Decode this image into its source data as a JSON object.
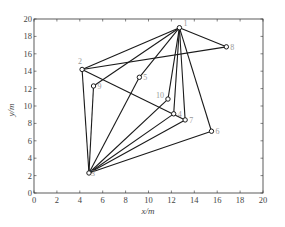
{
  "chart_data": {
    "type": "scatter",
    "title": "",
    "xlabel": "x/m",
    "ylabel": "y/m",
    "xlim": [
      0,
      20
    ],
    "ylim": [
      0,
      20
    ],
    "xticks": [
      0,
      2,
      4,
      6,
      8,
      10,
      12,
      14,
      16,
      18,
      20
    ],
    "yticks": [
      0,
      2,
      4,
      6,
      8,
      10,
      12,
      14,
      16,
      18,
      20
    ],
    "grid": false,
    "legend": null,
    "nodes": [
      {
        "id": "1",
        "x": 12.7,
        "y": 19.0
      },
      {
        "id": "2",
        "x": 4.2,
        "y": 14.2
      },
      {
        "id": "3",
        "x": 4.8,
        "y": 2.3
      },
      {
        "id": "4",
        "x": 12.2,
        "y": 9.1
      },
      {
        "id": "5",
        "x": 9.2,
        "y": 13.3
      },
      {
        "id": "6",
        "x": 15.5,
        "y": 7.1
      },
      {
        "id": "7",
        "x": 13.2,
        "y": 8.4
      },
      {
        "id": "8",
        "x": 16.8,
        "y": 16.8
      },
      {
        "id": "9",
        "x": 5.2,
        "y": 12.3
      },
      {
        "id": "10",
        "x": 11.7,
        "y": 10.8
      }
    ],
    "edges": [
      [
        "1",
        "2"
      ],
      [
        "1",
        "9"
      ],
      [
        "1",
        "5"
      ],
      [
        "1",
        "10"
      ],
      [
        "1",
        "4"
      ],
      [
        "1",
        "7"
      ],
      [
        "1",
        "6"
      ],
      [
        "1",
        "8"
      ],
      [
        "2",
        "8"
      ],
      [
        "2",
        "7"
      ],
      [
        "3",
        "2"
      ],
      [
        "3",
        "9"
      ],
      [
        "3",
        "5"
      ],
      [
        "3",
        "10"
      ],
      [
        "3",
        "4"
      ],
      [
        "3",
        "7"
      ],
      [
        "3",
        "6"
      ]
    ]
  },
  "colors": {
    "line": "#1a1a1a",
    "axis": "#333333",
    "label": "#999999",
    "tick_text": "#444444"
  }
}
